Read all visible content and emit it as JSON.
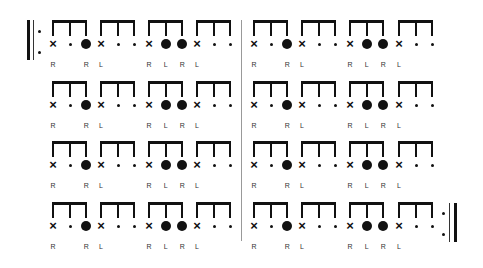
{
  "score": {
    "title": "",
    "layout": {
      "row_bracket_tops": [
        20,
        81,
        141,
        202
      ],
      "note_offset": 24,
      "label_offset": 45,
      "stem_height": 16,
      "group_starts": [
        52,
        100,
        148,
        196,
        253,
        301,
        349,
        398
      ],
      "note_spacing": 16.7,
      "middle_barline_x": 241,
      "middle_barline_top": 20,
      "middle_barline_bottom": 241
    },
    "start_repeat": {
      "thick_x": 27,
      "thin_x": 33,
      "dots_x": 38,
      "top": 20,
      "bottom": 60,
      "dot_ys": [
        30,
        51
      ]
    },
    "end_repeat": {
      "thick_x": 454,
      "thin_x": 449,
      "dots_x": 442,
      "top": 203,
      "bottom": 242,
      "dot_ys": [
        212,
        233
      ]
    },
    "measure_pattern": {
      "groups": [
        {
          "notes": [
            "x",
            "rest",
            "accent"
          ],
          "sticking": [
            "R",
            "",
            "R"
          ]
        },
        {
          "notes": [
            "x",
            "rest",
            "rest"
          ],
          "sticking": [
            "L",
            "",
            ""
          ]
        },
        {
          "notes": [
            "x",
            "accent",
            "accent"
          ],
          "sticking": [
            "R",
            "L",
            "R"
          ]
        },
        {
          "notes": [
            "x",
            "rest",
            "rest"
          ],
          "sticking": [
            "L",
            "",
            ""
          ]
        }
      ]
    },
    "rows": [
      {
        "row": 1,
        "measures": 2
      },
      {
        "row": 2,
        "measures": 2
      },
      {
        "row": 3,
        "measures": 2
      },
      {
        "row": 4,
        "measures": 2
      }
    ],
    "symbols": {
      "x": "×",
      "rest": "small-dot",
      "accent": "large-filled-dot"
    }
  }
}
